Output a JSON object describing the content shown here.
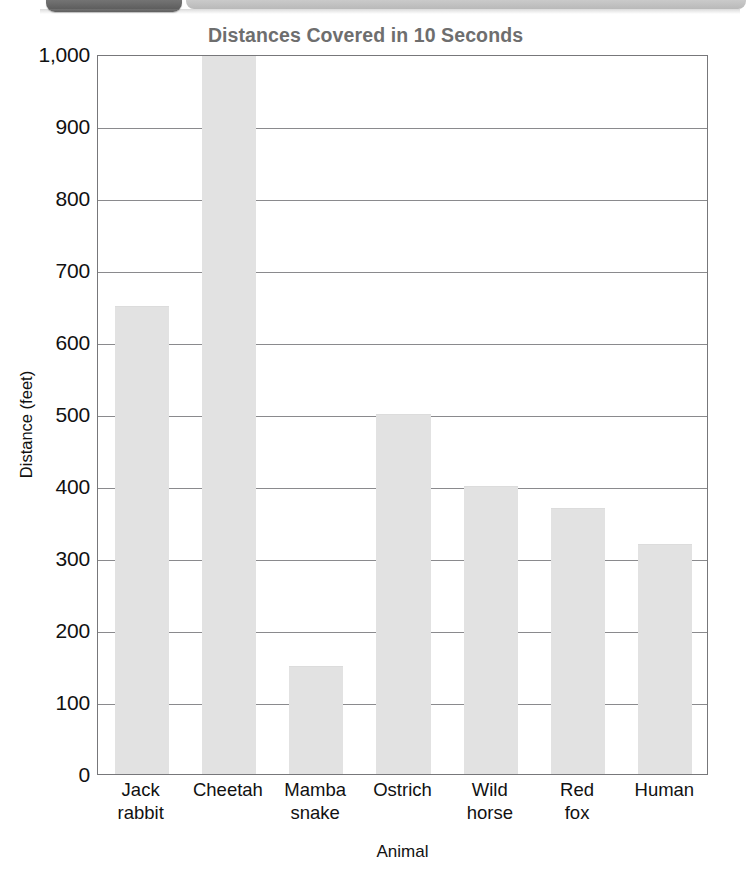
{
  "page_header": {
    "tab_icon": "page-tab-decoration",
    "bar_icon": "page-header-bar-decoration"
  },
  "chart_data": {
    "type": "bar",
    "title": "Distances Covered in 10 Seconds",
    "xlabel": "Animal",
    "ylabel": "Distance (feet)",
    "categories": [
      "Jack rabbit",
      "Cheetah",
      "Mamba snake",
      "Ostrich",
      "Wild horse",
      "Red fox",
      "Human"
    ],
    "category_lines": [
      [
        "Jack",
        "rabbit"
      ],
      [
        "Cheetah",
        ""
      ],
      [
        "Mamba",
        "snake"
      ],
      [
        "Ostrich",
        ""
      ],
      [
        "Wild",
        "horse"
      ],
      [
        "Red",
        "fox"
      ],
      [
        "Human",
        ""
      ]
    ],
    "values": [
      650,
      1000,
      150,
      500,
      400,
      370,
      320
    ],
    "value_notes": [
      "",
      "bar extends past top of chart (clipped at 1,000)",
      "",
      "",
      "",
      "",
      ""
    ],
    "ylim": [
      0,
      1000
    ],
    "ytick_step": 100,
    "ytick_labels": [
      "0",
      "100",
      "200",
      "300",
      "400",
      "500",
      "600",
      "700",
      "800",
      "900",
      "1,000"
    ],
    "grid": "horizontal",
    "legend": "none",
    "bar_color": "#e2e2e2",
    "axis_color": "#77777a",
    "title_color": "#6e6e6e"
  }
}
